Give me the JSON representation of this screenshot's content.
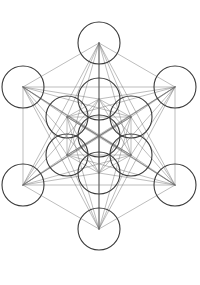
{
  "page": {
    "background_color": "#ffffff",
    "width": 200,
    "height": 285
  },
  "figure": {
    "name": "metatrons-cube",
    "stroke_color": "#3a3a3a",
    "line_color": "#6b6b6b",
    "circle_stroke_width": 1.1,
    "line_stroke_width": 0.45,
    "circle_radius": 21,
    "center": {
      "x": 99,
      "y": 136
    },
    "ring_inner_radius": 37,
    "ring_outer_radius": 74,
    "circle_count": 13,
    "circles": [
      {
        "label": "center",
        "cx": 99,
        "cy": 136
      },
      {
        "label": "inner-top",
        "cx": 99,
        "cy": 99
      },
      {
        "label": "inner-upper-right",
        "cx": 131,
        "cy": 117
      },
      {
        "label": "inner-lower-right",
        "cx": 131,
        "cy": 155
      },
      {
        "label": "inner-bottom",
        "cx": 99,
        "cy": 173
      },
      {
        "label": "inner-lower-left",
        "cx": 67,
        "cy": 155
      },
      {
        "label": "inner-upper-left",
        "cx": 67,
        "cy": 117
      },
      {
        "label": "outer-top",
        "cx": 99,
        "cy": 43
      },
      {
        "label": "outer-upper-right",
        "cx": 175,
        "cy": 87
      },
      {
        "label": "outer-lower-right",
        "cx": 175,
        "cy": 185
      },
      {
        "label": "outer-bottom",
        "cx": 99,
        "cy": 229
      },
      {
        "label": "outer-lower-left",
        "cx": 23,
        "cy": 185
      },
      {
        "label": "outer-upper-left",
        "cx": 23,
        "cy": 87
      }
    ]
  },
  "footer": {
    "left_text": "",
    "mid_text": "",
    "right_text": ""
  }
}
